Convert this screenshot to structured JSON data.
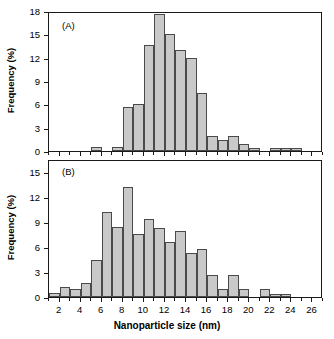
{
  "figure": {
    "xlabel": "Nanoparticle size (nm)",
    "ylabel": "Frequency (%)",
    "panel_a_label": "(A)",
    "panel_b_label": "(B)",
    "caption_fragment": ""
  },
  "chart_data": [
    {
      "type": "bar",
      "title": "(A)",
      "xlabel": "Nanoparticle size (nm)",
      "ylabel": "Frequency (%)",
      "xlim": [
        1,
        27
      ],
      "ylim": [
        0,
        18
      ],
      "yticks": [
        0,
        3,
        6,
        9,
        12,
        15,
        18
      ],
      "xticks": [
        2,
        4,
        6,
        8,
        10,
        12,
        14,
        16,
        18,
        20,
        22,
        24,
        26
      ],
      "grid": false,
      "legend": null,
      "bin_width": 1,
      "bin_centers": [
        1.5,
        2.5,
        3.5,
        4.5,
        5.5,
        6.5,
        7.5,
        8.5,
        9.5,
        10.5,
        11.5,
        12.5,
        13.5,
        14.5,
        15.5,
        16.5,
        17.5,
        18.5,
        19.5,
        20.5,
        21.5,
        22.5,
        23.5,
        24.5,
        25.5,
        26.5
      ],
      "values": [
        0,
        0,
        0,
        0,
        0.5,
        0,
        0.5,
        5.6,
        6.1,
        13.6,
        17.6,
        15.1,
        13.0,
        12.0,
        7.5,
        1.9,
        1.4,
        1.9,
        0.9,
        0.4,
        0,
        0.4,
        0.4,
        0.4,
        0,
        0
      ]
    },
    {
      "type": "bar",
      "title": "(B)",
      "xlabel": "Nanoparticle size (nm)",
      "ylabel": "Frequency (%)",
      "xlim": [
        1,
        27
      ],
      "ylim": [
        0,
        16.5
      ],
      "yticks": [
        0,
        3,
        6,
        9,
        12,
        15
      ],
      "xticks": [
        2,
        4,
        6,
        8,
        10,
        12,
        14,
        16,
        18,
        20,
        22,
        24,
        26
      ],
      "grid": false,
      "legend": null,
      "bin_width": 1,
      "bin_centers": [
        1.5,
        2.5,
        3.5,
        4.5,
        5.5,
        6.5,
        7.5,
        8.5,
        9.5,
        10.5,
        11.5,
        12.5,
        13.5,
        14.5,
        15.5,
        16.5,
        17.5,
        18.5,
        19.5,
        20.5,
        21.5,
        22.5,
        23.5,
        24.5,
        25.5,
        26.5
      ],
      "values": [
        0.5,
        1.2,
        0.9,
        1.7,
        4.4,
        10.2,
        8.4,
        13.2,
        7.5,
        9.3,
        8.3,
        6.6,
        7.9,
        5.3,
        5.8,
        2.6,
        0.9,
        2.6,
        0.9,
        0,
        0.9,
        0.4,
        0.4,
        0,
        0,
        0
      ]
    }
  ]
}
